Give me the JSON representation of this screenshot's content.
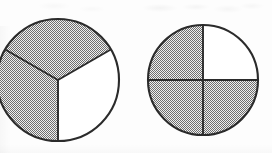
{
  "figure": {
    "background_color": "#fdfdfd",
    "width": 272,
    "height": 153,
    "shade_color": "#9a9a9a",
    "unshaded_color": "#ffffff",
    "outline_color": "#2b2b2b",
    "fill_style": "dithered-checkerboard-gray"
  },
  "chart_data": {
    "type": "pie",
    "xlabel": "",
    "ylabel": "",
    "legend_position": "none",
    "grid": false,
    "charts": [
      {
        "name": "left-circle",
        "label": "thirds",
        "denominator": 3,
        "numerator_shaded": 2,
        "fraction": "2/3",
        "center_x": 58,
        "center_y": 80,
        "radius": 61,
        "clipped_edge": "left",
        "start_angle_deg": 90,
        "slices": [
          {
            "name": "slice-top",
            "value": 1,
            "share": 0.3333,
            "angle_deg": 120,
            "shaded": true,
            "color": "#9a9a9a"
          },
          {
            "name": "slice-right",
            "value": 1,
            "share": 0.3333,
            "angle_deg": 120,
            "shaded": true,
            "color": "#9a9a9a"
          },
          {
            "name": "slice-lower-left",
            "value": 1,
            "share": 0.3333,
            "angle_deg": 120,
            "shaded": false,
            "color": "#ffffff"
          }
        ]
      },
      {
        "name": "right-circle",
        "label": "quarters",
        "denominator": 4,
        "numerator_shaded": 3,
        "fraction": "3/4",
        "center_x": 203,
        "center_y": 80,
        "radius": 55,
        "clipped_edge": "none",
        "start_angle_deg": 0,
        "slices": [
          {
            "name": "quadrant-top-left",
            "value": 1,
            "share": 0.25,
            "angle_deg": 90,
            "shaded": true,
            "color": "#9a9a9a"
          },
          {
            "name": "quadrant-top-right",
            "value": 1,
            "share": 0.25,
            "angle_deg": 90,
            "shaded": true,
            "color": "#9a9a9a"
          },
          {
            "name": "quadrant-bottom-right",
            "value": 1,
            "share": 0.25,
            "angle_deg": 90,
            "shaded": true,
            "color": "#9a9a9a"
          },
          {
            "name": "quadrant-bottom-left",
            "value": 1,
            "share": 0.25,
            "angle_deg": 90,
            "shaded": false,
            "color": "#ffffff"
          }
        ]
      }
    ]
  }
}
